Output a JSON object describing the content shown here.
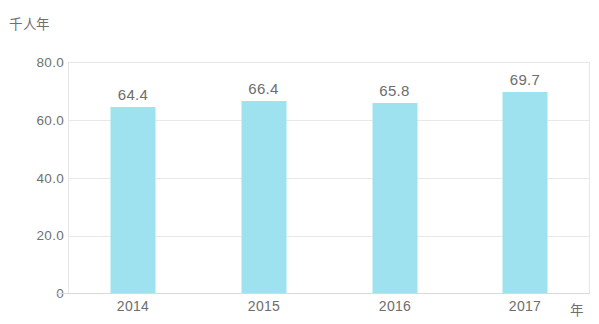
{
  "chart_data": {
    "type": "bar",
    "title": "",
    "subtitle": "",
    "xlabel": "年",
    "ylabel": "千人年",
    "categories": [
      "2014",
      "2015",
      "2016",
      "2017"
    ],
    "values": [
      64.4,
      66.4,
      65.8,
      69.7
    ],
    "value_labels": [
      "64.4",
      "66.4",
      "65.8",
      "69.7"
    ],
    "ylim": [
      0,
      80
    ],
    "yticks": [
      80,
      60,
      40,
      20,
      0
    ],
    "ytick_labels": [
      "80.0",
      "60.0",
      "40.0",
      "20.0",
      "0"
    ],
    "grid": true,
    "legend": "none",
    "series": [
      {
        "name": "",
        "values": [
          64.4,
          66.4,
          65.8,
          69.7
        ],
        "color": "#9ee2ef"
      }
    ],
    "colors": {
      "bar": "#9ee2ef",
      "grid": "#e8e8e8",
      "axis": "#d9d9d9",
      "text": "#6d6d6d",
      "background": "#ffffff"
    }
  }
}
